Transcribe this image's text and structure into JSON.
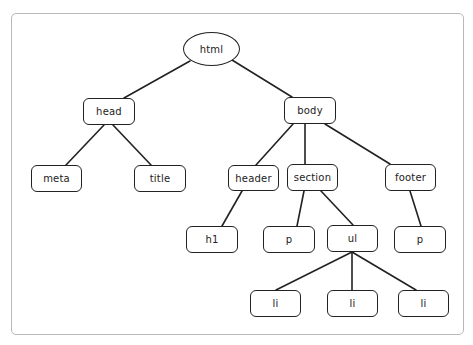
{
  "diagram": {
    "type": "tree",
    "frame": {
      "border_color": "#b9b9b9"
    },
    "stroke_color": "#222222",
    "nodes": [
      {
        "id": "html",
        "label": "html",
        "shape": "ellipse",
        "x": 183,
        "y": 32,
        "w": 57,
        "h": 34
      },
      {
        "id": "head",
        "label": "head",
        "shape": "rect",
        "x": 83,
        "y": 98,
        "w": 52,
        "h": 27
      },
      {
        "id": "body",
        "label": "body",
        "shape": "rect",
        "x": 284,
        "y": 97,
        "w": 52,
        "h": 27
      },
      {
        "id": "meta",
        "label": "meta",
        "shape": "rect",
        "x": 31,
        "y": 165,
        "w": 51,
        "h": 27
      },
      {
        "id": "title",
        "label": "title",
        "shape": "rect",
        "x": 134,
        "y": 165,
        "w": 52,
        "h": 27
      },
      {
        "id": "header",
        "label": "header",
        "shape": "rect",
        "x": 228,
        "y": 165,
        "w": 51,
        "h": 26
      },
      {
        "id": "section",
        "label": "section",
        "shape": "rect",
        "x": 287,
        "y": 164,
        "w": 51,
        "h": 27
      },
      {
        "id": "footer",
        "label": "footer",
        "shape": "rect",
        "x": 385,
        "y": 164,
        "w": 51,
        "h": 27
      },
      {
        "id": "h1",
        "label": "h1",
        "shape": "rect",
        "x": 186,
        "y": 226,
        "w": 52,
        "h": 27
      },
      {
        "id": "p1",
        "label": "p",
        "shape": "rect",
        "x": 263,
        "y": 226,
        "w": 52,
        "h": 27
      },
      {
        "id": "ul",
        "label": "ul",
        "shape": "rect",
        "x": 327,
        "y": 225,
        "w": 51,
        "h": 27
      },
      {
        "id": "p2",
        "label": "p",
        "shape": "rect",
        "x": 394,
        "y": 226,
        "w": 52,
        "h": 27
      },
      {
        "id": "li1",
        "label": "li",
        "shape": "rect",
        "x": 250,
        "y": 290,
        "w": 51,
        "h": 27
      },
      {
        "id": "li2",
        "label": "li",
        "shape": "rect",
        "x": 327,
        "y": 290,
        "w": 51,
        "h": 27
      },
      {
        "id": "li3",
        "label": "li",
        "shape": "rect",
        "x": 398,
        "y": 290,
        "w": 51,
        "h": 27
      }
    ],
    "edges": [
      {
        "from": "html",
        "to": "head",
        "x1": 190,
        "y1": 61,
        "x2": 124,
        "y2": 98
      },
      {
        "from": "html",
        "to": "body",
        "x1": 232,
        "y1": 60,
        "x2": 292,
        "y2": 97
      },
      {
        "from": "head",
        "to": "meta",
        "x1": 104,
        "y1": 125,
        "x2": 66,
        "y2": 165
      },
      {
        "from": "head",
        "to": "title",
        "x1": 113,
        "y1": 125,
        "x2": 151,
        "y2": 165
      },
      {
        "from": "body",
        "to": "header",
        "x1": 293,
        "y1": 124,
        "x2": 256,
        "y2": 165
      },
      {
        "from": "body",
        "to": "section",
        "x1": 305,
        "y1": 124,
        "x2": 305,
        "y2": 164
      },
      {
        "from": "body",
        "to": "footer",
        "x1": 325,
        "y1": 124,
        "x2": 390,
        "y2": 164
      },
      {
        "from": "header",
        "to": "h1",
        "x1": 242,
        "y1": 191,
        "x2": 222,
        "y2": 226
      },
      {
        "from": "section",
        "to": "p1",
        "x1": 304,
        "y1": 191,
        "x2": 297,
        "y2": 226
      },
      {
        "from": "section",
        "to": "ul",
        "x1": 321,
        "y1": 191,
        "x2": 353,
        "y2": 225
      },
      {
        "from": "footer",
        "to": "p2",
        "x1": 410,
        "y1": 191,
        "x2": 421,
        "y2": 226
      },
      {
        "from": "ul",
        "to": "li1",
        "x1": 352,
        "y1": 252,
        "x2": 276,
        "y2": 290
      },
      {
        "from": "ul",
        "to": "li2",
        "x1": 352,
        "y1": 252,
        "x2": 352,
        "y2": 290
      },
      {
        "from": "ul",
        "to": "li3",
        "x1": 352,
        "y1": 252,
        "x2": 416,
        "y2": 290
      }
    ]
  }
}
